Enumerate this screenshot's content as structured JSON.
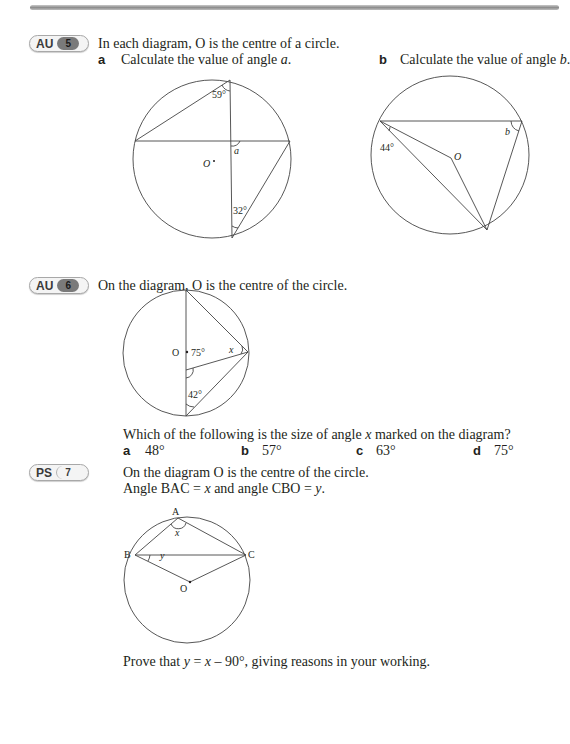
{
  "header": {
    "bar": "decorative-top-rule"
  },
  "questions": [
    {
      "badge": {
        "type": "AU",
        "number": "5"
      },
      "prompt": "In each diagram, O is the centre of a circle.",
      "parts": [
        {
          "label": "a",
          "text_pre": "Calculate the value of angle ",
          "var": "a",
          "text_post": "."
        },
        {
          "label": "b",
          "text_pre": "Calculate the value of angle ",
          "var": "b",
          "text_post": "."
        }
      ],
      "diagram_a": {
        "angle1": "59°",
        "angle2": "32°",
        "unknown": "a",
        "centre": "O"
      },
      "diagram_b": {
        "angle1": "44°",
        "unknown": "b",
        "centre": "O"
      }
    },
    {
      "badge": {
        "type": "AU",
        "number": "6"
      },
      "prompt": "On the diagram, O is the centre of the circle.",
      "diagram": {
        "centre": "O",
        "angle1": "75°",
        "angle2": "42°",
        "unknown": "x"
      },
      "question_pre": "Which of the following is the size of angle ",
      "question_var": "x",
      "question_post": " marked on the diagram?",
      "options": [
        {
          "label": "a",
          "value": "48°"
        },
        {
          "label": "b",
          "value": "57°"
        },
        {
          "label": "c",
          "value": "63°"
        },
        {
          "label": "d",
          "value": "75°"
        }
      ]
    },
    {
      "badge": {
        "type": "PS",
        "number": "7"
      },
      "prompt": "On the diagram O is the centre of the circle.",
      "line2_a": "Angle BAC = ",
      "line2_x": "x",
      "line2_b": " and angle CBO = ",
      "line2_y": "y",
      "line2_c": ".",
      "diagram": {
        "A": "A",
        "B": "B",
        "C": "C",
        "O": "O",
        "x": "x",
        "y": "y"
      },
      "prove_a": "Prove that ",
      "prove_y": "y",
      "prove_b": " = ",
      "prove_x": "x",
      "prove_c": " – 90°, giving reasons in your working."
    }
  ]
}
